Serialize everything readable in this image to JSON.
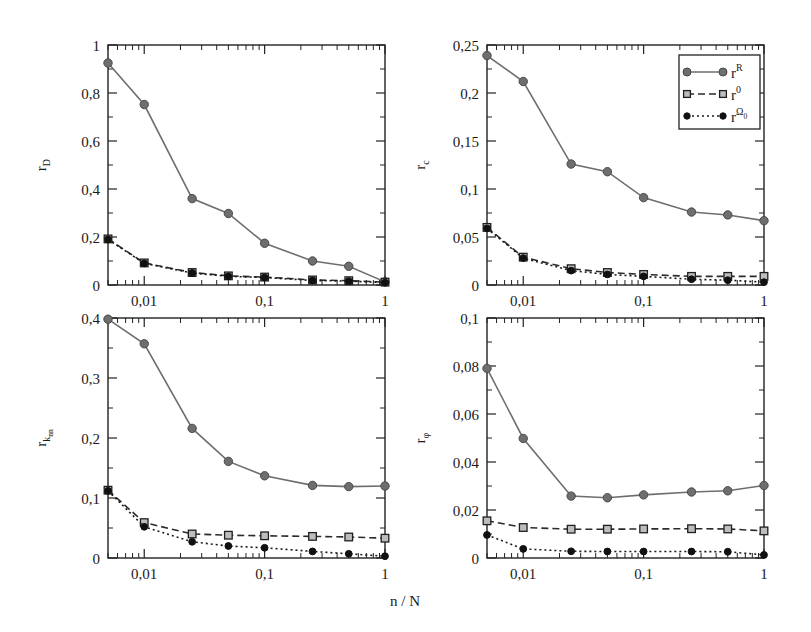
{
  "figure": {
    "xlabel": "n / N",
    "legend": {
      "title": "",
      "entries": [
        {
          "base": "r",
          "sup": "R",
          "marker": "filled-circle-gray",
          "line": "solid",
          "color": "#6e6e6e"
        },
        {
          "base": "r",
          "sup": "0",
          "marker": "open-square",
          "line": "dashed",
          "color": "#2b2b2b"
        },
        {
          "base": "r",
          "sup": "Ω",
          "sup_sub": "0",
          "marker": "filled-circle-black",
          "line": "dotted",
          "color": "#1a1a1a"
        }
      ]
    }
  },
  "chart_data": [
    {
      "type": "line",
      "panel": "top-left",
      "title": "",
      "xlabel": "n / N",
      "ylabel": "r",
      "ylabel_sub": "D",
      "xscale": "log",
      "xlim": [
        0.005,
        1
      ],
      "ylim": [
        0,
        1
      ],
      "yticks": [
        0,
        0.2,
        0.4,
        0.6,
        0.8,
        1
      ],
      "yticklabels": [
        "0",
        "0,2",
        "0,4",
        "0,6",
        "0,8",
        "1"
      ],
      "xticks": [
        0.01,
        0.1,
        1
      ],
      "xticklabels": [
        "0,01",
        "0,1",
        "1"
      ],
      "grid": false,
      "x": [
        0.005,
        0.01,
        0.025,
        0.05,
        0.1,
        0.25,
        0.5,
        1.0
      ],
      "series": [
        {
          "name": "r^R",
          "values": [
            0.925,
            0.752,
            0.36,
            0.298,
            0.174,
            0.1,
            0.078,
            0.013
          ]
        },
        {
          "name": "r^0",
          "values": [
            0.192,
            0.092,
            0.052,
            0.038,
            0.033,
            0.021,
            0.018,
            0.012
          ]
        },
        {
          "name": "r^Omega0",
          "values": [
            0.19,
            0.09,
            0.05,
            0.036,
            0.031,
            0.019,
            0.016,
            0.01
          ]
        }
      ]
    },
    {
      "type": "line",
      "panel": "top-right",
      "title": "",
      "xlabel": "n / N",
      "ylabel": "r",
      "ylabel_sub": "c",
      "xscale": "log",
      "xlim": [
        0.005,
        1
      ],
      "ylim": [
        0,
        0.25
      ],
      "yticks": [
        0,
        0.05,
        0.1,
        0.15,
        0.2,
        0.25
      ],
      "yticklabels": [
        "0",
        "0,05",
        "0,1",
        "0,15",
        "0,2",
        "0,25"
      ],
      "xticks": [
        0.01,
        0.1,
        1
      ],
      "xticklabels": [
        "0,01",
        "0,1",
        "1"
      ],
      "grid": false,
      "x": [
        0.005,
        0.01,
        0.025,
        0.05,
        0.1,
        0.25,
        0.5,
        1.0
      ],
      "series": [
        {
          "name": "r^R",
          "values": [
            0.239,
            0.212,
            0.126,
            0.118,
            0.091,
            0.076,
            0.073,
            0.067
          ]
        },
        {
          "name": "r^0",
          "values": [
            0.06,
            0.029,
            0.017,
            0.013,
            0.011,
            0.009,
            0.009,
            0.009
          ]
        },
        {
          "name": "r^Omega0",
          "values": [
            0.059,
            0.028,
            0.015,
            0.011,
            0.009,
            0.006,
            0.005,
            0.003
          ]
        }
      ]
    },
    {
      "type": "line",
      "panel": "bottom-left",
      "title": "",
      "xlabel": "n / N",
      "ylabel": "r",
      "ylabel_sub": "k",
      "ylabel_subsub": "nn",
      "xscale": "log",
      "xlim": [
        0.005,
        1
      ],
      "ylim": [
        0,
        0.4
      ],
      "yticks": [
        0,
        0.1,
        0.2,
        0.3,
        0.4
      ],
      "yticklabels": [
        "0",
        "0,1",
        "0,2",
        "0,3",
        "0,4"
      ],
      "xticks": [
        0.01,
        0.1,
        1
      ],
      "xticklabels": [
        "0,01",
        "0,1",
        "1"
      ],
      "grid": false,
      "x": [
        0.005,
        0.01,
        0.025,
        0.05,
        0.1,
        0.25,
        0.5,
        1.0
      ],
      "series": [
        {
          "name": "r^R",
          "values": [
            0.398,
            0.357,
            0.216,
            0.161,
            0.137,
            0.121,
            0.119,
            0.12
          ]
        },
        {
          "name": "r^0",
          "values": [
            0.113,
            0.059,
            0.04,
            0.038,
            0.037,
            0.036,
            0.035,
            0.033
          ]
        },
        {
          "name": "r^Omega0",
          "values": [
            0.112,
            0.052,
            0.027,
            0.02,
            0.017,
            0.011,
            0.007,
            0.003
          ]
        }
      ]
    },
    {
      "type": "line",
      "panel": "bottom-right",
      "title": "",
      "xlabel": "n / N",
      "ylabel": "r",
      "ylabel_sub": "φ",
      "xscale": "log",
      "xlim": [
        0.005,
        1
      ],
      "ylim": [
        0,
        0.1
      ],
      "yticks": [
        0,
        0.02,
        0.04,
        0.06,
        0.08,
        0.1
      ],
      "yticklabels": [
        "0",
        "0,02",
        "0,04",
        "0,06",
        "0,08",
        "0,1"
      ],
      "xticks": [
        0.01,
        0.1,
        1
      ],
      "xticklabels": [
        "0,01",
        "0,1",
        "1"
      ],
      "grid": false,
      "x": [
        0.005,
        0.01,
        0.025,
        0.05,
        0.1,
        0.25,
        0.5,
        1.0
      ],
      "series": [
        {
          "name": "r^R",
          "values": [
            0.079,
            0.0498,
            0.0258,
            0.0251,
            0.0263,
            0.0275,
            0.028,
            0.0302
          ]
        },
        {
          "name": "r^0",
          "values": [
            0.0155,
            0.0127,
            0.012,
            0.012,
            0.0121,
            0.0122,
            0.0121,
            0.0113
          ]
        },
        {
          "name": "r^Omega0",
          "values": [
            0.0096,
            0.0038,
            0.0028,
            0.0027,
            0.0027,
            0.0027,
            0.0026,
            0.0013
          ]
        }
      ]
    }
  ]
}
